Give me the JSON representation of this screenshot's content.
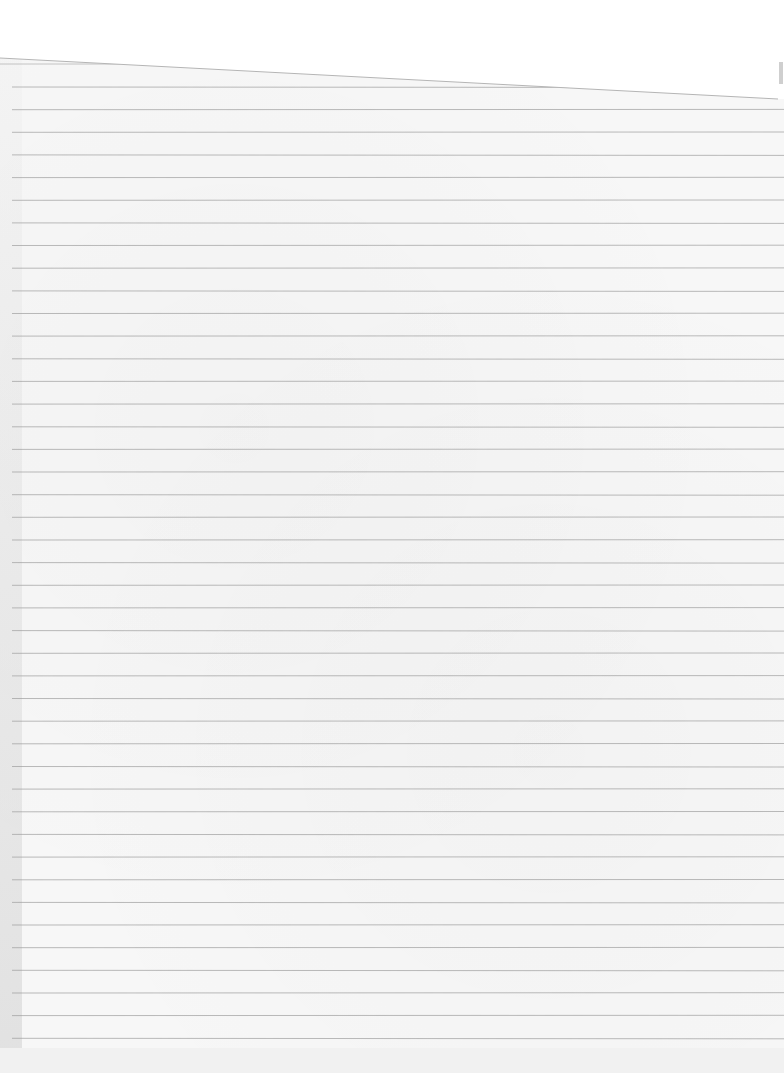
{
  "page": {
    "text_content": [],
    "colors": {
      "paper": "#f7f7f7",
      "top_flap": "#ffffff",
      "rule_line": "#9a9a9a",
      "left_shadow": "#d8d8d8",
      "bottom_strip": "#f1f1f1"
    },
    "rules": {
      "count": 43,
      "first_y": 87,
      "spacing": 22.65,
      "x_start": 12,
      "x_end": 784
    },
    "top_edge": {
      "from": [
        0,
        58
      ],
      "to": [
        778,
        99
      ]
    }
  }
}
